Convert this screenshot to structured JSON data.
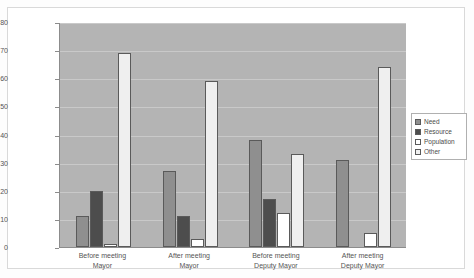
{
  "chart_data": {
    "type": "bar",
    "title": "",
    "xlabel": "",
    "ylabel": "",
    "ylim": [
      0,
      80
    ],
    "ytick_step": 10,
    "yticks": [
      "0",
      "10",
      "20",
      "30",
      "40",
      "50",
      "60",
      "70",
      "80"
    ],
    "grid": true,
    "legend_position": "right",
    "categories": [
      "Before meeting Mayor",
      "After meeting Mayor",
      "Before meeting Deputy Mayor",
      "After meeting Deputy Mayor"
    ],
    "category_lines": [
      [
        "Before meeting",
        "Mayor"
      ],
      [
        "After meeting",
        "Mayor"
      ],
      [
        "Before meeting",
        "Deputy Mayor"
      ],
      [
        "After meeting",
        "Deputy Mayor"
      ]
    ],
    "series": [
      {
        "name": "Need",
        "color": "#8f8f8f",
        "values": [
          11,
          27,
          38,
          31
        ]
      },
      {
        "name": "Resource",
        "color": "#4d4d4d",
        "values": [
          20,
          11,
          17,
          0
        ]
      },
      {
        "name": "Population",
        "color": "#ffffff",
        "values": [
          1,
          3,
          12,
          5
        ]
      },
      {
        "name": "Other",
        "color": "#efefef",
        "values": [
          69,
          59,
          33,
          64
        ]
      }
    ]
  },
  "legend": {
    "items": [
      {
        "label": "Need"
      },
      {
        "label": "Resource"
      },
      {
        "label": "Population"
      },
      {
        "label": "Other"
      }
    ]
  },
  "colors": {
    "plot_background": "#b4b4b4",
    "gridline": "#c9c9c9",
    "axis": "#8c8c8c",
    "bar_outline": "#5a5a5a",
    "canvas": "#ffffff",
    "frame_border": "#d9d9d9"
  }
}
